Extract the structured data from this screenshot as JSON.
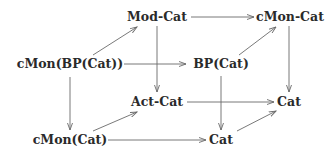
{
  "diagram": {
    "type": "commutative-cube",
    "nodes": [
      {
        "id": "modcat",
        "label": "Mod-Cat"
      },
      {
        "id": "cmoncat",
        "label": "cMon-Cat"
      },
      {
        "id": "cmonbpcat",
        "label": "cMon(BP(Cat))"
      },
      {
        "id": "bpcat",
        "label": "BP(Cat)"
      },
      {
        "id": "actcat",
        "label": "Act-Cat"
      },
      {
        "id": "cat_right",
        "label": "Cat"
      },
      {
        "id": "cmoncat2",
        "label": "cMon(Cat)"
      },
      {
        "id": "cat_bottom",
        "label": "Cat"
      }
    ],
    "edges": [
      {
        "from": "modcat",
        "to": "cmoncat"
      },
      {
        "from": "cmonbpcat",
        "to": "modcat"
      },
      {
        "from": "cmonbpcat",
        "to": "bpcat"
      },
      {
        "from": "bpcat",
        "to": "cmoncat"
      },
      {
        "from": "modcat",
        "to": "actcat"
      },
      {
        "from": "cmoncat",
        "to": "cat_right"
      },
      {
        "from": "cmonbpcat",
        "to": "cmoncat2"
      },
      {
        "from": "bpcat",
        "to": "cat_bottom"
      },
      {
        "from": "actcat",
        "to": "cat_right"
      },
      {
        "from": "cmoncat2",
        "to": "actcat"
      },
      {
        "from": "cmoncat2",
        "to": "cat_bottom"
      },
      {
        "from": "cat_bottom",
        "to": "cat_right"
      }
    ]
  }
}
